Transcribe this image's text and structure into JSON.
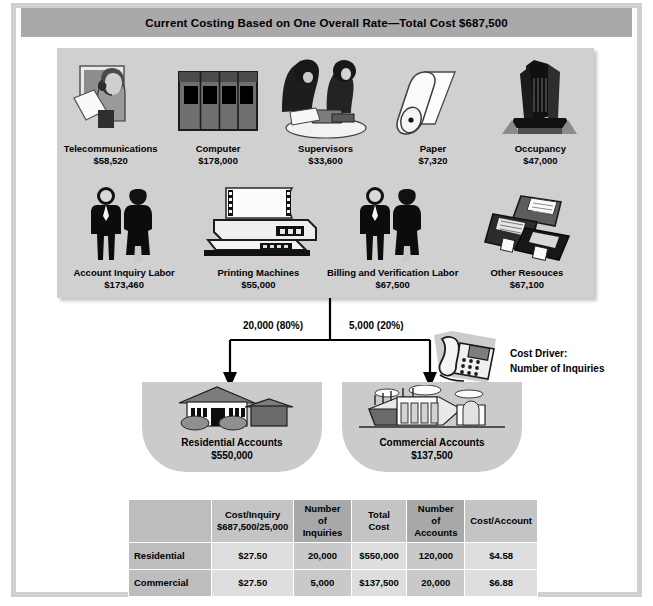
{
  "title": "Current Costing Based on One Overall Rate—Total Cost $687,500",
  "resource_pool": {
    "row1": [
      {
        "icon": "telephone-operator-icon",
        "name": "Telecommunications",
        "amount": "$58,520"
      },
      {
        "icon": "computer-mainframe-icon",
        "name": "Computer",
        "amount": "$178,000"
      },
      {
        "icon": "supervisors-desk-icon",
        "name": "Supervisors",
        "amount": "$33,600"
      },
      {
        "icon": "paper-roll-icon",
        "name": "Paper",
        "amount": "$7,320"
      },
      {
        "icon": "office-building-icon",
        "name": "Occupancy",
        "amount": "$47,000"
      }
    ],
    "row2": [
      {
        "icon": "two-people-icon",
        "name": "Account Inquiry Labor",
        "amount": "$173,460"
      },
      {
        "icon": "dot-matrix-printer-icon",
        "name": "Printing Machines",
        "amount": "$55,000"
      },
      {
        "icon": "two-people-icon",
        "name": "Billing and Verification Labor",
        "amount": "$67,500"
      },
      {
        "icon": "floppy-disks-icon",
        "name": "Other Resouces",
        "amount": "$67,100"
      }
    ]
  },
  "flow": {
    "left_label": "20,000 (80%)",
    "right_label": "5,000 (20%)"
  },
  "cost_driver": {
    "icon": "telephone-icon",
    "line1": "Cost Driver:",
    "line2": "Number of Inquiries"
  },
  "accounts": [
    {
      "icon": "house-icon",
      "name": "Residential Accounts",
      "amount": "$550,000"
    },
    {
      "icon": "factory-icon",
      "name": "Commercial Accounts",
      "amount": "$137,500"
    }
  ],
  "table": {
    "corner": "",
    "headers": [
      {
        "line1": "Cost/Inquiry",
        "line2": "$687,500/25,000"
      },
      {
        "line1": "Number of",
        "line2": "Inquiries"
      },
      {
        "line1": "Total Cost",
        "line2": ""
      },
      {
        "line1": "Number of",
        "line2": "Accounts"
      },
      {
        "line1": "Cost/Account",
        "line2": ""
      }
    ],
    "rows": [
      {
        "label": "Residential",
        "cells": [
          "$27.50",
          "20,000",
          "$550,000",
          "120,000",
          "$4.58"
        ]
      },
      {
        "label": "Commercial",
        "cells": [
          "$27.50",
          "5,000",
          "$137,500",
          "20,000",
          "$6.88"
        ]
      }
    ]
  },
  "colors": {
    "title_band": "#a9a9a9",
    "pool_panel": "#d0d0d0",
    "account_box": "#cbcbcb",
    "frame_border": "#cfcfcf"
  }
}
